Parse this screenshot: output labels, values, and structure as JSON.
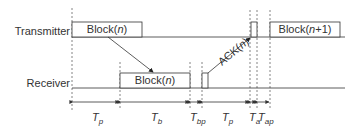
{
  "diagram": {
    "rows": {
      "transmitter": "Transmitter",
      "receiver": "Receiver"
    },
    "blocks": {
      "tx_block": {
        "prefix": "Block(",
        "var": "n",
        "suffix": ")"
      },
      "rx_block": {
        "prefix": "Block(",
        "var": "n",
        "suffix": ")"
      },
      "tx_next_block": {
        "prefix": "Block(",
        "var": "n",
        "suffix": "+1)"
      }
    },
    "ack": {
      "prefix": "ACK(",
      "var": "n",
      "suffix": ")"
    },
    "intervals": [
      {
        "symbol": "T",
        "sub": "p"
      },
      {
        "symbol": "T",
        "sub": "b"
      },
      {
        "symbol": "T",
        "sub": "bp"
      },
      {
        "symbol": "T",
        "sub": "p"
      },
      {
        "symbol": "T",
        "sub": "a"
      },
      {
        "symbol": "T",
        "sub": "ap"
      }
    ],
    "colors": {
      "line": "#333333",
      "dash": "#666666",
      "background": "#ffffff"
    }
  }
}
